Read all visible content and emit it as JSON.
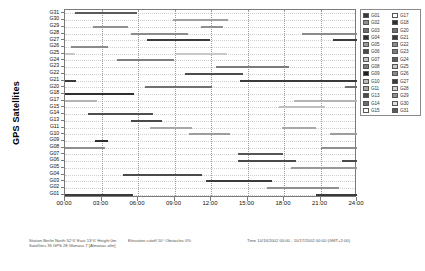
{
  "chart_data": {
    "type": "bar",
    "title": "",
    "ylabel": "GPS Satellites",
    "xlabel": "",
    "grid": true,
    "legend_position": "right",
    "xlim": [
      0,
      24
    ],
    "x_ticks": [
      "00:00",
      "03:00",
      "06:00",
      "09:00",
      "12:00",
      "15:00",
      "18:00",
      "21:00",
      "24:00"
    ],
    "x_tick_values": [
      0,
      3,
      6,
      9,
      12,
      15,
      18,
      21,
      24
    ],
    "categories": [
      "G01",
      "G02",
      "G03",
      "G04",
      "G05",
      "G06",
      "G07",
      "G08",
      "G09",
      "G10",
      "G11",
      "G13",
      "G14",
      "G15",
      "G17",
      "G18",
      "G20",
      "G21",
      "G22",
      "G23",
      "G24",
      "G25",
      "G26",
      "G27",
      "G28",
      "G29",
      "G30",
      "G31"
    ],
    "note": "Gantt-style satellite visibility windows; each row is one satellite, each bar is a visibility interval in hours.",
    "series": [
      {
        "name": "G01",
        "color": "#3a3a3a",
        "intervals": [
          [
            0.0,
            5.6
          ],
          [
            20.6,
            24.0
          ]
        ]
      },
      {
        "name": "G02",
        "color": "#8f8f8f",
        "intervals": [
          [
            16.6,
            22.5
          ]
        ]
      },
      {
        "name": "G03",
        "color": "#3c3c3c",
        "intervals": [
          [
            11.6,
            17.0
          ]
        ]
      },
      {
        "name": "G04",
        "color": "#4a4a4a",
        "intervals": [
          [
            4.8,
            11.3
          ]
        ]
      },
      {
        "name": "G05",
        "color": "#9a9a9a",
        "intervals": [
          [
            18.6,
            24.0
          ]
        ]
      },
      {
        "name": "G06",
        "color": "#4a4a4a",
        "intervals": [
          [
            14.2,
            19.0
          ],
          [
            22.8,
            24.0
          ]
        ]
      },
      {
        "name": "G07",
        "color": "#555555",
        "intervals": [
          [
            14.2,
            17.9
          ]
        ]
      },
      {
        "name": "G08",
        "color": "#8e8e8e",
        "intervals": [
          [
            0.0,
            3.3
          ],
          [
            21.0,
            24.0
          ]
        ]
      },
      {
        "name": "G09",
        "color": "#303030",
        "intervals": [
          [
            2.5,
            3.5
          ]
        ]
      },
      {
        "name": "G10",
        "color": "#9d9d9d",
        "intervals": [
          [
            10.2,
            13.6
          ],
          [
            21.8,
            24.0
          ]
        ]
      },
      {
        "name": "G11",
        "color": "#a8a8a8",
        "intervals": [
          [
            7.0,
            10.4
          ],
          [
            17.8,
            20.6
          ]
        ]
      },
      {
        "name": "G13",
        "color": "#4a4a4a",
        "intervals": [
          [
            5.4,
            8.0
          ]
        ]
      },
      {
        "name": "G14",
        "color": "#4d4d4d",
        "intervals": [
          [
            1.9,
            7.2
          ]
        ]
      },
      {
        "name": "G15",
        "color": "#c0c0c0",
        "intervals": [
          [
            17.6,
            21.4
          ]
        ]
      },
      {
        "name": "G17",
        "color": "#b4b4b4",
        "intervals": [
          [
            0.0,
            2.6
          ],
          [
            18.8,
            24.0
          ]
        ]
      },
      {
        "name": "G18",
        "color": "#2e2e2e",
        "intervals": [
          [
            0.0,
            5.7
          ]
        ]
      },
      {
        "name": "G20",
        "color": "#707070",
        "intervals": [
          [
            6.6,
            12.1
          ],
          [
            23.0,
            24.0
          ]
        ]
      },
      {
        "name": "G21",
        "color": "#3a3a3a",
        "intervals": [
          [
            0.0,
            0.9
          ],
          [
            14.4,
            24.0
          ]
        ]
      },
      {
        "name": "G22",
        "color": "#4c4c4c",
        "intervals": [
          [
            9.9,
            14.6
          ]
        ]
      },
      {
        "name": "G23",
        "color": "#7b7b7b",
        "intervals": [
          [
            12.4,
            18.4
          ]
        ]
      },
      {
        "name": "G24",
        "color": "#7e7e7e",
        "intervals": [
          [
            4.3,
            9.0
          ]
        ]
      },
      {
        "name": "G25",
        "color": "#c8c8c8",
        "intervals": [
          [
            0.0,
            0.8
          ],
          [
            9.1,
            13.3
          ]
        ]
      },
      {
        "name": "G26",
        "color": "#8a8a8a",
        "intervals": [
          [
            0.5,
            3.5
          ]
        ]
      },
      {
        "name": "G27",
        "color": "#3b3b3b",
        "intervals": [
          [
            6.7,
            11.9
          ],
          [
            22.0,
            24.0
          ]
        ]
      },
      {
        "name": "G28",
        "color": "#8b8b8b",
        "intervals": [
          [
            5.4,
            10.1
          ],
          [
            19.5,
            24.0
          ]
        ]
      },
      {
        "name": "G29",
        "color": "#909090",
        "intervals": [
          [
            2.3,
            5.2
          ],
          [
            11.2,
            13.0
          ]
        ]
      },
      {
        "name": "G30",
        "color": "#9f9f9f",
        "intervals": [
          [
            8.9,
            13.4
          ]
        ]
      },
      {
        "name": "G31",
        "color": "#5a5a5a",
        "intervals": [
          [
            0.8,
            5.9
          ]
        ]
      }
    ]
  },
  "legend": {
    "column1": [
      {
        "label": "G01",
        "color": "#3a3a3a"
      },
      {
        "label": "G02",
        "color": "#8f8f8f"
      },
      {
        "label": "G03",
        "color": "#6e6e6e"
      },
      {
        "label": "G04",
        "color": "#2f2f2f"
      },
      {
        "label": "G05",
        "color": "#9a9a9a"
      },
      {
        "label": "G06",
        "color": "#4a4a4a"
      },
      {
        "label": "G07",
        "color": "#c5c5c5"
      },
      {
        "label": "G08",
        "color": "#7d7d7d"
      },
      {
        "label": "G09",
        "color": "#1f1f1f"
      },
      {
        "label": "G10",
        "color": "#b9b9b9"
      },
      {
        "label": "G11",
        "color": "#a8a8a8"
      },
      {
        "label": "G13",
        "color": "#4a4a4a"
      },
      {
        "label": "G14",
        "color": "#6d6d6d"
      },
      {
        "label": "G15",
        "color": "#ffffff"
      }
    ],
    "column2": [
      {
        "label": "G17",
        "color": "#ffffff"
      },
      {
        "label": "G18",
        "color": "#2e2e2e"
      },
      {
        "label": "G20",
        "color": "#707070"
      },
      {
        "label": "G21",
        "color": "#3a3a3a"
      },
      {
        "label": "G22",
        "color": "#8c8c8c"
      },
      {
        "label": "G23",
        "color": "#7b7b7b"
      },
      {
        "label": "G24",
        "color": "#5d5d5d"
      },
      {
        "label": "G25",
        "color": "#c8c8c8"
      },
      {
        "label": "G26",
        "color": "#8a8a8a"
      },
      {
        "label": "G27",
        "color": "#3b3b3b"
      },
      {
        "label": "G28",
        "color": "#d2d2d2"
      },
      {
        "label": "G29",
        "color": "#909090"
      },
      {
        "label": "G30",
        "color": "#e0e0e0"
      },
      {
        "label": "G31",
        "color": "#5a5a5a"
      }
    ]
  },
  "status": {
    "left_line1": "Station Berlin  North 52°0'  East 13°0'  Height 0m",
    "left_line2": "Satellites 35  GPS 28  Glonass 7  [Almanac.alm]",
    "mid_line1": "Elevation cutoff 10°   Obstacles 0%",
    "right_line1": "Time 10/16/2002 00:00 - 10/17/2002 00:00 (GMT+2:00)"
  }
}
